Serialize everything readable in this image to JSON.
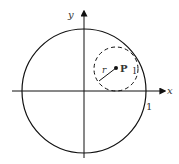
{
  "diagram": {
    "axes": {
      "x_label": "x",
      "y_label": "y"
    },
    "unit_circle": {
      "radius_label": "1"
    },
    "small_circle": {
      "center_label": "P",
      "radius_label": "r",
      "side_label": "l",
      "style": "dashed"
    },
    "colors": {
      "stroke": "#111111",
      "label": "#333333",
      "background": "#ffffff"
    }
  }
}
